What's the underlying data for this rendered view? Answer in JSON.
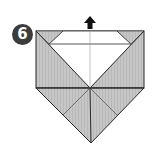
{
  "diagram": {
    "type": "origami-step",
    "step_number": "6",
    "instruction_arrow": "up",
    "colors": {
      "paper_shaded": "#c4c4c4",
      "paper_white": "#ffffff",
      "line": "#2a2a2a",
      "crease": "#8a8a8a",
      "badge": "#3c3c3c"
    },
    "elements": [
      "step-number-badge",
      "up-arrow",
      "white-trapezoid-flap",
      "shaded-side-triangles",
      "bottom-point-shape",
      "center-crease"
    ]
  }
}
